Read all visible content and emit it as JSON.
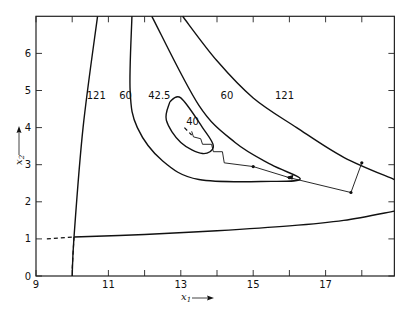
{
  "chart_data": {
    "type": "line",
    "subtype": "contour-plot-with-search-path",
    "title": "",
    "xlabel": "x1",
    "ylabel": "x2",
    "xlim": [
      9,
      18.9
    ],
    "ylim": [
      0,
      7
    ],
    "x_ticks": [
      9,
      10,
      11,
      12,
      13,
      14,
      15,
      16,
      17,
      18
    ],
    "x_tick_labels": [
      "9",
      "11",
      "13",
      "15",
      "17"
    ],
    "y_ticks": [
      0,
      1,
      2,
      3,
      4,
      5,
      6
    ],
    "y_tick_labels": [
      "0",
      "1",
      "2",
      "3",
      "4",
      "5",
      "6"
    ],
    "grid": false,
    "legend": null,
    "contours": [
      {
        "level": "121",
        "label": "121",
        "branch": "left",
        "points": [
          [
            10.0,
            0.0
          ],
          [
            10.05,
            1.05
          ],
          [
            10.3,
            4.0
          ],
          [
            10.7,
            7.0
          ]
        ]
      },
      {
        "level": "121",
        "label": "121",
        "branch": "right",
        "points": [
          [
            13.05,
            7.0
          ],
          [
            14.0,
            5.8
          ],
          [
            15.0,
            4.8
          ],
          [
            16.2,
            4.0
          ],
          [
            17.5,
            3.2
          ],
          [
            18.9,
            2.6
          ]
        ]
      },
      {
        "level": "60",
        "label": "60",
        "points": [
          [
            11.65,
            7.0
          ],
          [
            11.6,
            5.0
          ],
          [
            11.8,
            4.0
          ],
          [
            12.5,
            3.1
          ],
          [
            13.5,
            2.6
          ],
          [
            15.5,
            2.55
          ],
          [
            16.3,
            2.62
          ],
          [
            15.5,
            3.0
          ],
          [
            14.5,
            3.6
          ],
          [
            13.5,
            4.6
          ],
          [
            12.2,
            7.0
          ]
        ]
      },
      {
        "level": "42.5",
        "label": "42.5",
        "points": [
          [
            12.7,
            4.7
          ],
          [
            13.0,
            4.8
          ],
          [
            13.6,
            4.0
          ],
          [
            13.9,
            3.5
          ],
          [
            13.6,
            3.3
          ],
          [
            13.0,
            3.6
          ],
          [
            12.6,
            4.2
          ],
          [
            12.7,
            4.7
          ]
        ]
      },
      {
        "level": "lower-boundary",
        "label": "",
        "points": [
          [
            10.05,
            1.05
          ],
          [
            12.0,
            1.12
          ],
          [
            14.0,
            1.22
          ],
          [
            16.0,
            1.35
          ],
          [
            17.5,
            1.5
          ],
          [
            18.9,
            1.75
          ]
        ]
      }
    ],
    "dashed_lines": [
      {
        "points": [
          [
            9.3,
            1.0
          ],
          [
            10.05,
            1.05
          ]
        ]
      },
      {
        "points": [
          [
            10.0,
            0.2
          ],
          [
            10.05,
            1.05
          ]
        ]
      },
      {
        "points": [
          [
            13.1,
            4.0
          ],
          [
            13.3,
            3.8
          ]
        ]
      }
    ],
    "search_path": {
      "points": [
        [
          18.0,
          3.05
        ],
        [
          17.7,
          2.25
        ],
        [
          16.0,
          2.65
        ],
        [
          15.0,
          2.95
        ],
        [
          14.2,
          3.05
        ],
        [
          14.15,
          3.35
        ],
        [
          13.9,
          3.35
        ],
        [
          13.85,
          3.55
        ],
        [
          13.6,
          3.55
        ],
        [
          13.55,
          3.7
        ],
        [
          13.35,
          3.75
        ],
        [
          13.3,
          3.9
        ]
      ],
      "arrow_at": [
        16.0,
        2.65
      ],
      "end_label": "40"
    },
    "annotations": [
      {
        "text": "121",
        "x": 10.4,
        "y": 4.85
      },
      {
        "text": "60",
        "x": 11.3,
        "y": 4.85
      },
      {
        "text": "42.5",
        "x": 12.1,
        "y": 4.85
      },
      {
        "text": "60",
        "x": 14.1,
        "y": 4.85
      },
      {
        "text": "121",
        "x": 15.6,
        "y": 4.85
      },
      {
        "text": "40",
        "x": 13.15,
        "y": 4.15
      }
    ]
  },
  "labels": {
    "x_axis": "x",
    "x_axis_sub": "1",
    "y_axis": "x",
    "y_axis_sub": "2"
  }
}
